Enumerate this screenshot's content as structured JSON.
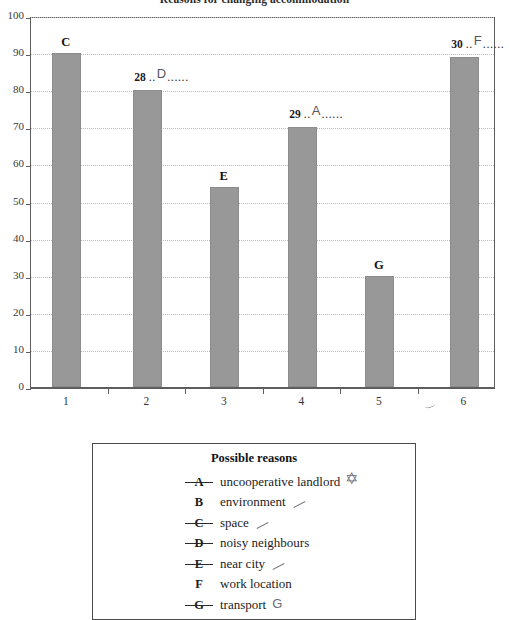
{
  "chart_data": {
    "type": "bar",
    "title": "Reasons for changing accommodation",
    "xlabel": "",
    "ylabel": "",
    "ylim": [
      0,
      100
    ],
    "grid": true,
    "legend_position": "below-chart",
    "categories": [
      "1",
      "2",
      "3",
      "4",
      "5",
      "6"
    ],
    "values": [
      90,
      80,
      54,
      70,
      30,
      89
    ],
    "bar_labels": [
      "C",
      "28",
      "E",
      "29",
      "G",
      "30"
    ],
    "y_ticks": [
      "0",
      "10",
      "20",
      "30",
      "40",
      "50",
      "60",
      "70",
      "80",
      "90",
      "100"
    ],
    "series": [
      {
        "name": "Reasons for changing accommodation",
        "values": [
          90,
          80,
          54,
          70,
          30,
          89
        ]
      }
    ],
    "bar_color": "#989898"
  },
  "chart": {
    "title": "Reasons for changing accommodation",
    "y_ticks": [
      "100",
      "90",
      "80",
      "70",
      "60",
      "50",
      "40",
      "30",
      "20",
      "10",
      "0"
    ],
    "x_ticks": [
      "1",
      "2",
      "3",
      "4",
      "5",
      "6"
    ],
    "bars": [
      {
        "category": "1",
        "value": 90,
        "label": "C",
        "label_type": "printed"
      },
      {
        "category": "2",
        "value": 80,
        "label": "28",
        "label_type": "question",
        "dots": "......",
        "answer": "D"
      },
      {
        "category": "3",
        "value": 54,
        "label": "E",
        "label_type": "printed"
      },
      {
        "category": "4",
        "value": 70,
        "label": "29",
        "label_type": "question",
        "dots": "......",
        "answer": "A"
      },
      {
        "category": "5",
        "value": 30,
        "label": "G",
        "label_type": "printed"
      },
      {
        "category": "6",
        "value": 89,
        "label": "30",
        "label_type": "question",
        "dots": "......",
        "answer": "F"
      }
    ]
  },
  "legend": {
    "title": "Possible reasons",
    "items": [
      {
        "key": "A",
        "text": "uncooperative landlord",
        "struck": true,
        "mark": "star"
      },
      {
        "key": "B",
        "text": "environment",
        "struck": false,
        "mark": "tick"
      },
      {
        "key": "C",
        "text": "space",
        "struck": true,
        "mark": "tick"
      },
      {
        "key": "D",
        "text": "noisy neighbours",
        "struck": true,
        "mark": "none"
      },
      {
        "key": "E",
        "text": "near city",
        "struck": true,
        "mark": "tick"
      },
      {
        "key": "F",
        "text": "work location",
        "struck": false,
        "mark": "none"
      },
      {
        "key": "G",
        "text": "transport",
        "struck": true,
        "mark": "pencil",
        "pencil": "G"
      }
    ]
  }
}
